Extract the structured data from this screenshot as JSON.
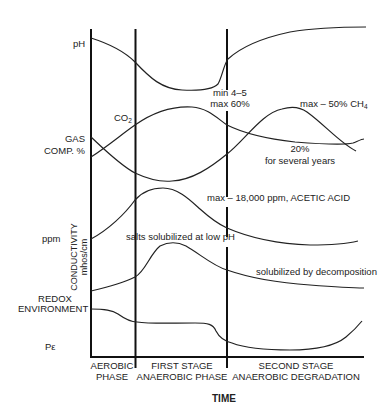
{
  "diagram": {
    "type": "landfill-phases-diagram",
    "x_axis_label": "TIME",
    "row_labels": {
      "ph": "pH",
      "gas_1": "GAS",
      "gas_2": "COMP. %",
      "ppm": "ppm",
      "conductivity_1": "CONDUCTIVITY",
      "conductivity_2": "mhos/cm",
      "redox_1": "REDOX",
      "redox_2": "ENVIRONMENT",
      "pe": "Pε"
    },
    "phases": [
      {
        "line1": "AEROBIC",
        "line2": "PHASE"
      },
      {
        "line1": "FIRST STAGE",
        "line2": "ANAEROBIC PHASE"
      },
      {
        "line1": "SECOND STAGE",
        "line2": "ANAEROBIC DEGRADATION"
      }
    ],
    "annotations": {
      "co2_main": "CO",
      "co2_sub": "2",
      "ph_min": "min 4–5",
      "co2_max": "max 60%",
      "ch4_main": "max – 50% CH",
      "ch4_sub": "4",
      "co2_long_1": "20%",
      "co2_long_2": "for several years",
      "acetic": "max – 18,000 ppm, ACETIC ACID",
      "salts": "salts solubilized at low pH",
      "decomp": "solubilized by decomposition"
    },
    "curves": [
      {
        "name": "pH",
        "trend": "declines in aerobic phase, minimum 4–5 in first anaerobic stage, rises in second stage"
      },
      {
        "name": "CO2",
        "trend": "rises to max 60% in first anaerobic stage, settles near 20% for several years"
      },
      {
        "name": "O2/N2 gas",
        "trend": "declines through aerobic and first anaerobic stage"
      },
      {
        "name": "CH4",
        "trend": "rises in second stage to max ~50%, then declines"
      },
      {
        "name": "Acetic acid (ppm)",
        "trend": "peaks at ~18,000 ppm in first anaerobic stage, then declines"
      },
      {
        "name": "Conductivity",
        "trend": "salts solubilized at low pH peak, then gradual decline by decomposition"
      },
      {
        "name": "Redox (Pε)",
        "trend": "drops at anaerobic transitions, minimum in second stage, then rises"
      }
    ]
  }
}
